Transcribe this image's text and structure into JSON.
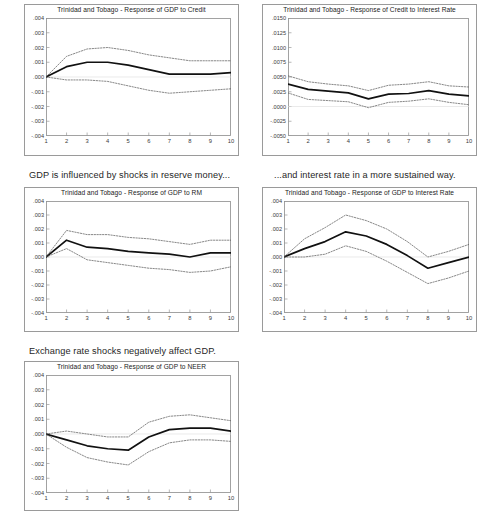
{
  "page": {
    "background": "#ffffff",
    "series_colors": {
      "response": "#111111",
      "confidence_band": "#555555"
    }
  },
  "captions": {
    "reserve_money": "GDP is influenced by shocks in reserve money...",
    "interest_rate": "...and interest rate in a more sustained way.",
    "exchange_rate": "Exchange rate shocks negatively affect GDP."
  },
  "charts": [
    {
      "id": "gdp-credit",
      "title": "Trinidad and Tobago - Response of GDP to Credit"
    },
    {
      "id": "credit-ir",
      "title": "Trinidad and Tobago - Response of Credit to Interest Rate"
    },
    {
      "id": "gdp-rm",
      "title": "Trinidad and Tobago - Response of GDP to RM"
    },
    {
      "id": "gdp-ir",
      "title": "Trinidad and Tobago - Response of GDP to Interest Rate"
    },
    {
      "id": "gdp-neer",
      "title": "Trinidad and Tobago - Response of GDP to NEER"
    }
  ],
  "chart_data": [
    {
      "type": "line",
      "id": "gdp-credit",
      "title": "Trinidad and Tobago - Response of GDP to Credit",
      "xlabel": "",
      "ylabel": "",
      "x": [
        1,
        2,
        3,
        4,
        5,
        6,
        7,
        8,
        9,
        10
      ],
      "xticklabels": [
        "1",
        "2",
        "3",
        "4",
        "5",
        "6",
        "7",
        "8",
        "9",
        "10"
      ],
      "yticks": [
        0.004,
        0.003,
        0.002,
        0.001,
        0.0,
        -0.001,
        -0.002,
        -0.003,
        -0.004
      ],
      "yticklabels": [
        ".004",
        ".003",
        ".002",
        ".001",
        ".000",
        "-.001",
        "-.002",
        "-.003",
        "-.004"
      ],
      "ylim": [
        -0.004,
        0.004
      ],
      "xlim": [
        1,
        10
      ],
      "grid": false,
      "legend": "none",
      "series": [
        {
          "name": "Response",
          "style": "solid",
          "values": [
            0.0,
            0.0007,
            0.001,
            0.001,
            0.0008,
            0.0005,
            0.0002,
            0.0002,
            0.0002,
            0.0003
          ]
        },
        {
          "name": "Upper 2 S.E.",
          "style": "dotted",
          "values": [
            0.0,
            0.0014,
            0.0019,
            0.002,
            0.0018,
            0.0015,
            0.0013,
            0.0011,
            0.0011,
            0.0011
          ]
        },
        {
          "name": "Lower 2 S.E.",
          "style": "dotted",
          "values": [
            0.0,
            -0.0002,
            -0.0002,
            -0.0003,
            -0.0006,
            -0.0009,
            -0.0011,
            -0.001,
            -0.0009,
            -0.0008
          ]
        }
      ]
    },
    {
      "type": "line",
      "id": "credit-ir",
      "title": "Trinidad and Tobago - Response of Credit to Interest Rate",
      "xlabel": "",
      "ylabel": "",
      "x": [
        1,
        2,
        3,
        4,
        5,
        6,
        7,
        8,
        9,
        10
      ],
      "xticklabels": [
        "1",
        "2",
        "3",
        "4",
        "5",
        "6",
        "7",
        "8",
        "9",
        "10"
      ],
      "yticks": [
        0.015,
        0.0125,
        0.01,
        0.0075,
        0.005,
        0.0025,
        0.0,
        -0.0025,
        -0.005
      ],
      "yticklabels": [
        ".0150",
        ".0125",
        ".0100",
        ".0075",
        ".0050",
        ".0025",
        ".0000",
        "-.0025",
        "-.0050"
      ],
      "ylim": [
        -0.005,
        0.015
      ],
      "xlim": [
        1,
        10
      ],
      "grid": false,
      "legend": "none",
      "series": [
        {
          "name": "Response",
          "style": "solid",
          "values": [
            0.0038,
            0.0029,
            0.0026,
            0.0023,
            0.0013,
            0.0021,
            0.0022,
            0.0027,
            0.0021,
            0.0018
          ]
        },
        {
          "name": "Upper 2 S.E.",
          "style": "dotted",
          "values": [
            0.0052,
            0.0042,
            0.0038,
            0.0035,
            0.0027,
            0.0036,
            0.0038,
            0.0042,
            0.0035,
            0.0033
          ]
        },
        {
          "name": "Lower 2 S.E.",
          "style": "dotted",
          "values": [
            0.0023,
            0.0012,
            0.001,
            0.0008,
            -0.0002,
            0.0007,
            0.0009,
            0.0013,
            0.0007,
            0.0003
          ]
        }
      ]
    },
    {
      "type": "line",
      "id": "gdp-rm",
      "title": "Trinidad and Tobago - Response of GDP to RM",
      "xlabel": "",
      "ylabel": "",
      "x": [
        1,
        2,
        3,
        4,
        5,
        6,
        7,
        8,
        9,
        10
      ],
      "xticklabels": [
        "1",
        "2",
        "3",
        "4",
        "5",
        "6",
        "7",
        "8",
        "9",
        "10"
      ],
      "yticks": [
        0.004,
        0.003,
        0.002,
        0.001,
        0.0,
        -0.001,
        -0.002,
        -0.003,
        -0.004
      ],
      "yticklabels": [
        ".004",
        ".003",
        ".002",
        ".001",
        ".000",
        "-.001",
        "-.002",
        "-.003",
        "-.004"
      ],
      "ylim": [
        -0.004,
        0.004
      ],
      "xlim": [
        1,
        10
      ],
      "grid": false,
      "legend": "none",
      "series": [
        {
          "name": "Response",
          "style": "solid",
          "values": [
            0.0,
            0.0012,
            0.0007,
            0.0006,
            0.0004,
            0.0003,
            0.0002,
            0.0,
            0.0003,
            0.0003
          ]
        },
        {
          "name": "Upper 2 S.E.",
          "style": "dotted",
          "values": [
            0.0,
            0.0019,
            0.0016,
            0.0016,
            0.0014,
            0.0013,
            0.0011,
            0.0009,
            0.0012,
            0.0012
          ]
        },
        {
          "name": "Lower 2 S.E.",
          "style": "dotted",
          "values": [
            0.0,
            0.0006,
            -0.0002,
            -0.0004,
            -0.0006,
            -0.0008,
            -0.0009,
            -0.0011,
            -0.001,
            -0.0007
          ]
        }
      ]
    },
    {
      "type": "line",
      "id": "gdp-ir",
      "title": "Trinidad and Tobago - Response of GDP to Interest Rate",
      "xlabel": "",
      "ylabel": "",
      "x": [
        1,
        2,
        3,
        4,
        5,
        6,
        7,
        8,
        9,
        10
      ],
      "xticklabels": [
        "1",
        "2",
        "3",
        "4",
        "5",
        "6",
        "7",
        "8",
        "9",
        "10"
      ],
      "yticks": [
        0.004,
        0.003,
        0.002,
        0.001,
        0.0,
        -0.001,
        -0.002,
        -0.003,
        -0.004
      ],
      "yticklabels": [
        ".004",
        ".003",
        ".002",
        ".001",
        ".000",
        "-.001",
        "-.002",
        "-.003",
        "-.004"
      ],
      "ylim": [
        -0.004,
        0.004
      ],
      "xlim": [
        1,
        10
      ],
      "grid": false,
      "legend": "none",
      "series": [
        {
          "name": "Response",
          "style": "solid",
          "values": [
            0.0,
            0.0006,
            0.0011,
            0.0018,
            0.0015,
            0.0009,
            0.0001,
            -0.0008,
            -0.0004,
            0.0
          ]
        },
        {
          "name": "Upper 2 S.E.",
          "style": "dotted",
          "values": [
            0.0,
            0.0013,
            0.0021,
            0.003,
            0.0026,
            0.002,
            0.0011,
            0.0,
            0.0004,
            0.0009
          ]
        },
        {
          "name": "Lower 2 S.E.",
          "style": "dotted",
          "values": [
            0.0,
            0.0,
            0.0002,
            0.0008,
            0.0004,
            -0.0003,
            -0.0011,
            -0.0019,
            -0.0015,
            -0.001
          ]
        }
      ]
    },
    {
      "type": "line",
      "id": "gdp-neer",
      "title": "Trinidad and Tobago - Response of GDP to NEER",
      "xlabel": "",
      "ylabel": "",
      "x": [
        1,
        2,
        3,
        4,
        5,
        6,
        7,
        8,
        9,
        10
      ],
      "xticklabels": [
        "1",
        "2",
        "3",
        "4",
        "5",
        "6",
        "7",
        "8",
        "9",
        "10"
      ],
      "yticks": [
        0.004,
        0.003,
        0.002,
        0.001,
        0.0,
        -0.001,
        -0.002,
        -0.003,
        -0.004
      ],
      "yticklabels": [
        ".004",
        ".003",
        ".002",
        ".001",
        ".000",
        "-.001",
        "-.002",
        "-.003",
        "-.004"
      ],
      "ylim": [
        -0.004,
        0.004
      ],
      "xlim": [
        1,
        10
      ],
      "grid": false,
      "legend": "none",
      "series": [
        {
          "name": "Response",
          "style": "solid",
          "values": [
            0.0,
            -0.0004,
            -0.0008,
            -0.001,
            -0.0011,
            -0.0002,
            0.0003,
            0.0004,
            0.0004,
            0.0002
          ]
        },
        {
          "name": "Upper 2 S.E.",
          "style": "dotted",
          "values": [
            0.0,
            0.0002,
            0.0,
            -0.0002,
            -0.0002,
            0.0008,
            0.0012,
            0.0013,
            0.0011,
            0.0009
          ]
        },
        {
          "name": "Lower 2 S.E.",
          "style": "dotted",
          "values": [
            0.0,
            -0.0009,
            -0.0016,
            -0.0019,
            -0.0021,
            -0.0012,
            -0.0006,
            -0.0004,
            -0.0004,
            -0.0005
          ]
        }
      ]
    }
  ]
}
